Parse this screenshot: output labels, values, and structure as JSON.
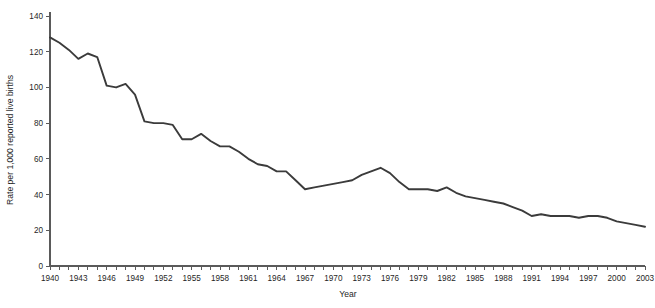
{
  "chart_data": {
    "type": "line",
    "title": "",
    "xlabel": "Year",
    "ylabel": "Rate per 1,000 reported live births",
    "xlim": [
      1940,
      2003
    ],
    "ylim": [
      0,
      140
    ],
    "grid": false,
    "legend": null,
    "y_ticks": [
      0,
      20,
      40,
      60,
      80,
      100,
      120,
      140
    ],
    "y_tick_labels": [
      "0",
      "20",
      "40",
      "60",
      "80",
      "100",
      "120",
      "140"
    ],
    "x_tick_years": [
      1940,
      1941,
      1942,
      1943,
      1944,
      1945,
      1946,
      1947,
      1948,
      1949,
      1950,
      1951,
      1952,
      1953,
      1954,
      1955,
      1956,
      1957,
      1958,
      1959,
      1960,
      1961,
      1962,
      1963,
      1964,
      1965,
      1966,
      1967,
      1968,
      1969,
      1970,
      1971,
      1972,
      1973,
      1974,
      1975,
      1976,
      1977,
      1978,
      1979,
      1980,
      1981,
      1982,
      1983,
      1984,
      1985,
      1986,
      1987,
      1988,
      1989,
      1990,
      1991,
      1992,
      1993,
      1994,
      1995,
      1996,
      1997,
      1998,
      1999,
      2000,
      2001,
      2002,
      2003
    ],
    "x_tick_labels": [
      "1940",
      "1943",
      "1946",
      "1949",
      "1952",
      "1955",
      "1958",
      "1961",
      "1964",
      "1967",
      "1970",
      "1973",
      "1976",
      "1979",
      "1982",
      "1985",
      "1988",
      "1991",
      "1994",
      "1997",
      "2000",
      "2003"
    ],
    "x_labeled_years": [
      1940,
      1943,
      1946,
      1949,
      1952,
      1955,
      1958,
      1961,
      1964,
      1967,
      1970,
      1973,
      1976,
      1979,
      1982,
      1985,
      1988,
      1991,
      1994,
      1997,
      2000,
      2003
    ],
    "series": [
      {
        "name": "Rate per 1,000 reported live births",
        "color": "#3b3b3b",
        "x": [
          1940,
          1941,
          1942,
          1943,
          1944,
          1945,
          1946,
          1947,
          1948,
          1949,
          1950,
          1951,
          1952,
          1953,
          1954,
          1955,
          1956,
          1957,
          1958,
          1959,
          1960,
          1961,
          1962,
          1963,
          1964,
          1965,
          1966,
          1967,
          1968,
          1969,
          1970,
          1971,
          1972,
          1973,
          1974,
          1975,
          1976,
          1977,
          1978,
          1979,
          1980,
          1981,
          1982,
          1983,
          1984,
          1985,
          1986,
          1987,
          1988,
          1989,
          1990,
          1991,
          1992,
          1993,
          1994,
          1995,
          1996,
          1997,
          1998,
          1999,
          2000,
          2001,
          2002,
          2003
        ],
        "y": [
          128,
          125,
          121,
          116,
          119,
          117,
          101,
          100,
          102,
          96,
          81,
          80,
          80,
          79,
          71,
          71,
          74,
          70,
          67,
          67,
          64,
          60,
          57,
          56,
          53,
          53,
          48,
          43,
          44,
          45,
          46,
          47,
          48,
          51,
          53,
          55,
          52,
          47,
          43,
          43,
          43,
          42,
          44,
          41,
          39,
          38,
          37,
          36,
          35,
          33,
          31,
          28,
          29,
          28,
          28,
          28,
          27,
          28,
          28,
          27,
          25,
          24,
          23,
          22
        ]
      }
    ]
  }
}
